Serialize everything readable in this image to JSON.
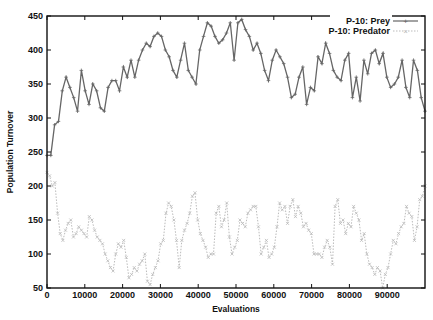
{
  "chart_data": {
    "type": "line",
    "title": "",
    "xlabel": "Evaluations",
    "ylabel": "Population Turnover",
    "xlim": [
      0,
      100000
    ],
    "ylim": [
      50,
      450
    ],
    "xticks": [
      0,
      10000,
      20000,
      30000,
      40000,
      50000,
      60000,
      70000,
      80000,
      90000
    ],
    "yticks": [
      50,
      100,
      150,
      200,
      250,
      300,
      350,
      400,
      450
    ],
    "grid": false,
    "legend_position": "top-right",
    "x_step": 1000,
    "series": [
      {
        "name": "P-10: Prey",
        "color": "#666666",
        "line_style": "solid",
        "marker": "+",
        "values": [
          245,
          245,
          290,
          295,
          340,
          360,
          345,
          330,
          310,
          370,
          340,
          320,
          350,
          340,
          315,
          310,
          345,
          355,
          355,
          340,
          375,
          360,
          385,
          360,
          385,
          400,
          410,
          405,
          420,
          425,
          420,
          400,
          390,
          370,
          360,
          385,
          410,
          370,
          360,
          350,
          400,
          420,
          440,
          435,
          420,
          410,
          415,
          425,
          440,
          385,
          440,
          445,
          430,
          420,
          400,
          410,
          395,
          370,
          355,
          385,
          400,
          390,
          380,
          360,
          330,
          335,
          360,
          375,
          320,
          345,
          340,
          390,
          380,
          410,
          395,
          370,
          360,
          355,
          385,
          395,
          330,
          360,
          325,
          385,
          365,
          395,
          400,
          380,
          395,
          360,
          345,
          350,
          360,
          385,
          345,
          330,
          385,
          370,
          330,
          310
        ]
      },
      {
        "name": "P-10: Predator",
        "color": "#bbbbbb",
        "line_style": "dotted",
        "marker": "x",
        "values": [
          220,
          215,
          200,
          205,
          160,
          130,
          120,
          135,
          145,
          150,
          125,
          130,
          140,
          135,
          130,
          125,
          155,
          150,
          135,
          125,
          120,
          115,
          100,
          90,
          80,
          75,
          100,
          115,
          110,
          120,
          95,
          65,
          70,
          80,
          75,
          85,
          90,
          100,
          60,
          55,
          70,
          80,
          90,
          115,
          120,
          160,
          175,
          170,
          150,
          120,
          80,
          120,
          135,
          145,
          160,
          185,
          190,
          150,
          130,
          120,
          110,
          95,
          100,
          100,
          160,
          170,
          140,
          150,
          175,
          125,
          100,
          110,
          120,
          150,
          145,
          140,
          160,
          165,
          170,
          170,
          140,
          100,
          110,
          120,
          95,
          100,
          110,
          140,
          175,
          165,
          170,
          145,
          170,
          180,
          155,
          170,
          160,
          140,
          145,
          135,
          130,
          100,
          100,
          100,
          95,
          110,
          120,
          110,
          85,
          170,
          180,
          145,
          150,
          130,
          145,
          140,
          170,
          160,
          150,
          120,
          130,
          100,
          85,
          80,
          70,
          80,
          75,
          50,
          70,
          80,
          100,
          120,
          115,
          130,
          140,
          145,
          170,
          160,
          155,
          120,
          140,
          180,
          185,
          200
        ]
      }
    ]
  },
  "legend": {
    "prey_label": "P-10: Prey",
    "predator_label": "P-10: Predator"
  },
  "axes": {
    "xlabel": "Evaluations",
    "ylabel": "Population Turnover"
  }
}
